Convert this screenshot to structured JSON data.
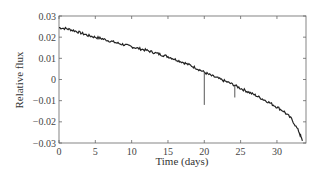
{
  "chart_data": {
    "type": "line",
    "title": "",
    "xlabel": "Time (days)",
    "ylabel": "Relative flux",
    "xlim": [
      0,
      34
    ],
    "ylim": [
      -0.03,
      0.03
    ],
    "xticks": [
      0,
      5,
      10,
      15,
      20,
      25,
      30
    ],
    "xtick_labels": [
      "0",
      "5",
      "10",
      "15",
      "20",
      "25",
      "30"
    ],
    "yticks": [
      0.03,
      0.02,
      0.01,
      0,
      -0.01,
      -0.02,
      -0.03
    ],
    "ytick_labels": [
      "0.03",
      "0.02",
      "0.01",
      "0",
      "−0.01",
      "−0.02",
      "−0.03"
    ],
    "grid": false,
    "legend": null,
    "series": [
      {
        "name": "light curve",
        "color": "#222222",
        "x": [
          0,
          1,
          2,
          3,
          4,
          5,
          6,
          7,
          8,
          9,
          10,
          11,
          12,
          13,
          14,
          15,
          16,
          17,
          18,
          19,
          20,
          21,
          22,
          23,
          24,
          25,
          26,
          27,
          28,
          29,
          30,
          31,
          32,
          33,
          33.5
        ],
        "y": [
          0.0245,
          0.024,
          0.0232,
          0.022,
          0.0208,
          0.02,
          0.0192,
          0.0182,
          0.0172,
          0.0164,
          0.0155,
          0.0146,
          0.0138,
          0.0128,
          0.0118,
          0.0108,
          0.0095,
          0.0082,
          0.0068,
          0.0052,
          0.0034,
          0.0018,
          0.0004,
          -0.001,
          -0.0024,
          -0.0042,
          -0.0058,
          -0.0074,
          -0.0092,
          -0.011,
          -0.013,
          -0.0152,
          -0.0186,
          -0.0244,
          -0.029
        ]
      }
    ],
    "annotations": [
      {
        "type": "outlier-dip",
        "x": 20.0,
        "y_low": -0.012
      },
      {
        "type": "outlier-dip",
        "x": 24.2,
        "y_low": -0.0085
      }
    ]
  }
}
